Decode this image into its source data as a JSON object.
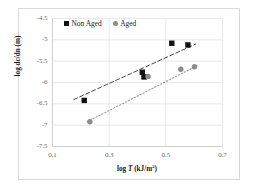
{
  "chart_data": {
    "type": "scatter",
    "title": "",
    "xlabel": "log T (kJ/m2)",
    "ylabel": "log dc/dn (m)",
    "xlim": [
      0.1,
      0.7
    ],
    "ylim": [
      -7.5,
      -4.5
    ],
    "xticks": [
      "0.1",
      "0.3",
      "0.5",
      "0.7"
    ],
    "xtick_values": [
      0.1,
      0.3,
      0.5,
      0.7
    ],
    "yticks": [
      "-4.5",
      "-5",
      "-5.5",
      "-6",
      "-6.5",
      "-7",
      "-7.5"
    ],
    "ytick_values": [
      -4.5,
      -5,
      -5.5,
      -6,
      -6.5,
      -7,
      -7.5
    ],
    "grid": true,
    "legend_position": "top-left-inside",
    "series": [
      {
        "name": "Non Aged",
        "marker": "square",
        "color": "#111111",
        "trendline": "dashed",
        "points": [
          {
            "x": 0.212,
            "y": -6.42
          },
          {
            "x": 0.417,
            "y": -5.76
          },
          {
            "x": 0.423,
            "y": -5.87
          },
          {
            "x": 0.521,
            "y": -5.08
          },
          {
            "x": 0.578,
            "y": -5.12
          }
        ],
        "trendline_from": {
          "x": 0.175,
          "y": -6.4
        },
        "trendline_to": {
          "x": 0.605,
          "y": -5.1
        }
      },
      {
        "name": "Aged",
        "marker": "circle",
        "color": "#8c8c8c",
        "trendline": "dotted",
        "points": [
          {
            "x": 0.232,
            "y": -6.92
          },
          {
            "x": 0.437,
            "y": -5.86
          },
          {
            "x": 0.553,
            "y": -5.69
          },
          {
            "x": 0.601,
            "y": -5.63
          }
        ],
        "trendline_from": {
          "x": 0.222,
          "y": -6.92
        },
        "trendline_to": {
          "x": 0.612,
          "y": -5.6
        }
      }
    ]
  },
  "legend": {
    "items": [
      {
        "label": "Non Aged",
        "marker": "square",
        "color": "#111111"
      },
      {
        "label": "Aged",
        "marker": "circle",
        "color": "#8c8c8c"
      }
    ]
  },
  "axes": {
    "x_title_prefix": "log ",
    "x_title_symbol": "T",
    "x_title_units": " (kJ/m",
    "x_title_exp": "2",
    "x_title_close": ")",
    "y_title": "log dc/dn (m)"
  },
  "colors": {
    "non_aged": "#111111",
    "aged": "#8c8c8c",
    "grid": "#e3e3e3",
    "axis_text": "#6b6b6b",
    "frame": "#d9d9d9"
  }
}
